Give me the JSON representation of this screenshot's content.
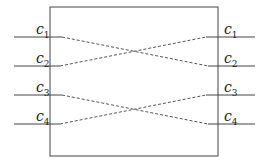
{
  "diagram": {
    "type": "crossover-permutation",
    "box": {
      "x": 50,
      "y": 7,
      "width": 168,
      "height": 149
    },
    "colors": {
      "line": "#444444",
      "dashed": "#555555",
      "background": "#ffffff"
    },
    "left_labels": [
      {
        "base": "c",
        "sub": "1",
        "y": 37
      },
      {
        "base": "c",
        "sub": "2",
        "y": 66
      },
      {
        "base": "c",
        "sub": "3",
        "y": 95
      },
      {
        "base": "c",
        "sub": "4",
        "y": 124
      }
    ],
    "right_labels": [
      {
        "base": "c",
        "sub": "1",
        "y": 37
      },
      {
        "base": "c",
        "sub": "2",
        "y": 66
      },
      {
        "base": "c",
        "sub": "3",
        "y": 95
      },
      {
        "base": "c",
        "sub": "4",
        "y": 124
      }
    ],
    "connections": [
      {
        "from": "c1",
        "to": "c2"
      },
      {
        "from": "c2",
        "to": "c1"
      },
      {
        "from": "c3",
        "to": "c4"
      },
      {
        "from": "c4",
        "to": "c3"
      }
    ]
  }
}
